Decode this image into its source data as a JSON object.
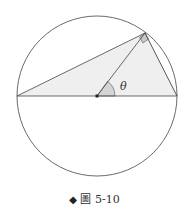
{
  "figure": {
    "caption_marker": "◆",
    "caption": "圖 5-10",
    "angle_label": "θ",
    "colors": {
      "stroke": "#444444",
      "triangle_fill": "#efefef",
      "right_angle_fill": "#c8c8c8",
      "angle_fill": "#d4d4d4"
    },
    "elements": [
      "circle",
      "diameter",
      "inscribed-triangle",
      "radius-to-vertex",
      "right-angle-marker",
      "angle-arc",
      "center-point"
    ]
  }
}
